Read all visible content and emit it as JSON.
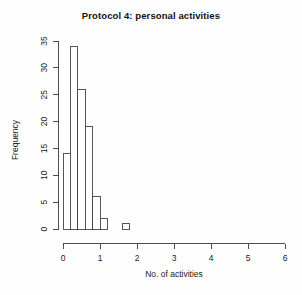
{
  "chart_data": {
    "type": "bar",
    "title": "Protocol 4: personal activities",
    "xlabel": "No. of activities",
    "ylabel": "Frequency",
    "xlim": [
      0,
      6
    ],
    "ylim": [
      0,
      35
    ],
    "xticks": [
      "0",
      "1",
      "2",
      "3",
      "4",
      "5",
      "6"
    ],
    "xtick_values": [
      0,
      1,
      2,
      3,
      4,
      5,
      6
    ],
    "yticks": [
      "0",
      "5",
      "10",
      "15",
      "20",
      "25",
      "30",
      "35"
    ],
    "ytick_values": [
      0,
      5,
      10,
      15,
      20,
      25,
      30,
      35
    ],
    "grid": false,
    "legend": null,
    "bin_width": 0.2,
    "bars": [
      {
        "bin_start": 0.0,
        "bin_end": 0.2,
        "value": 14
      },
      {
        "bin_start": 0.2,
        "bin_end": 0.4,
        "value": 34
      },
      {
        "bin_start": 0.4,
        "bin_end": 0.6,
        "value": 26
      },
      {
        "bin_start": 0.6,
        "bin_end": 0.8,
        "value": 19
      },
      {
        "bin_start": 0.8,
        "bin_end": 1.0,
        "value": 6
      },
      {
        "bin_start": 1.0,
        "bin_end": 1.2,
        "value": 2
      },
      {
        "bin_start": 1.6,
        "bin_end": 1.8,
        "value": 1
      }
    ],
    "categories": [
      "0.0-0.2",
      "0.2-0.4",
      "0.4-0.6",
      "0.6-0.8",
      "0.8-1.0",
      "1.0-1.2",
      "1.6-1.8"
    ],
    "values": [
      14,
      34,
      26,
      19,
      6,
      2,
      1
    ]
  }
}
